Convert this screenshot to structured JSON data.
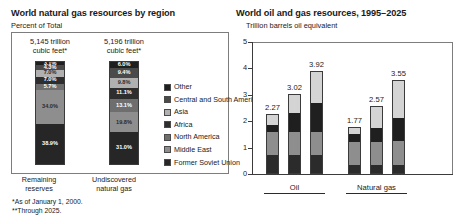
{
  "left_chart": {
    "title": "World natural gas resources by region",
    "subtitle": "Percent of Total",
    "bar1_header_line1": "5,145 trillion",
    "bar1_header_line2": "cubic feet*",
    "bar2_header_line1": "5,196 trillion",
    "bar2_header_line2": "cubic feet*",
    "bar1_label_line1": "Remaining",
    "bar1_label_line2": "reserves",
    "bar2_label_line1": "Undiscovered",
    "bar2_label_line2": "natural gas",
    "footnote1": "*As of January 1, 2000.",
    "footnote2": "**Through 2025.",
    "legend": [
      {
        "label": "Other",
        "color": "#1f1f1f"
      },
      {
        "label": "Central and South America",
        "color": "#4a4a4a"
      },
      {
        "label": "Asia",
        "color": "#b0b0b0"
      },
      {
        "label": "Africa",
        "color": "#2e2e2e"
      },
      {
        "label": "North America",
        "color": "#6e6e6e"
      },
      {
        "label": "Middle East",
        "color": "#8e8e8e"
      },
      {
        "label": "Former Soviet Union",
        "color": "#262626"
      }
    ]
  },
  "right_chart": {
    "title": "World oil and gas resources, 1995–2025",
    "subtitle": "Trillion barrels oil equivalent",
    "y_ticks": [
      "5",
      "4",
      "3",
      "2",
      "1",
      "0"
    ],
    "group1_label": "Oil",
    "group2_label": "Natural gas",
    "tick_labels": [
      "Low",
      "Mean",
      "High"
    ],
    "legend": [
      {
        "label_line1": "Undiscovered",
        "label_line2": "",
        "color": "#d4d4d4"
      },
      {
        "label_line1": "Reserve",
        "label_line2": "growth",
        "color": "#1f1f1f"
      },
      {
        "label_line1": "Remaining",
        "label_line2": "reserves",
        "color": "#8e8e8e"
      },
      {
        "label_line1": "Cumulative",
        "label_line2": "production",
        "color": "#2b2b2b"
      }
    ]
  },
  "chart_data": [
    {
      "type": "bar",
      "title": "World natural gas resources by region",
      "subtitle": "Percent of Total",
      "ylabel": "Percent of Total",
      "xlabel": "",
      "stacked": true,
      "categories": [
        "Remaining reserves",
        "Undiscovered natural gas"
      ],
      "category_totals_text": [
        "5,145 trillion cubic feet*",
        "5,196 trillion cubic feet*"
      ],
      "series": [
        {
          "name": "Other",
          "color": "#1f1f1f",
          "values": [
            3.1,
            6.0
          ]
        },
        {
          "name": "Central and South America",
          "color": "#4a4a4a",
          "values": [
            4.3,
            9.4
          ]
        },
        {
          "name": "Asia",
          "color": "#b0b0b0",
          "values": [
            7.0,
            9.8
          ]
        },
        {
          "name": "Africa",
          "color": "#2e2e2e",
          "values": [
            7.0,
            11.1
          ]
        },
        {
          "name": "North America",
          "color": "#6e6e6e",
          "values": [
            5.7,
            13.1
          ]
        },
        {
          "name": "Middle East",
          "color": "#8e8e8e",
          "values": [
            34.0,
            19.8
          ]
        },
        {
          "name": "Former Soviet Union",
          "color": "#262626",
          "values": [
            38.9,
            31.0
          ]
        }
      ],
      "value_labels": [
        [
          "3.1%",
          "4.3%",
          "7.0%",
          "7.0%",
          "5.7%",
          "34.0%",
          "38.9%"
        ],
        [
          "6.0%",
          "9.4%",
          "9.8%",
          "11.1%",
          "13.1%",
          "19.8%",
          "31.0%"
        ]
      ],
      "ylim": [
        0,
        100
      ],
      "grid": false,
      "legend_position": "right"
    },
    {
      "type": "bar",
      "title": "World oil and gas resources, 1995–2025",
      "subtitle": "Trillion barrels oil equivalent",
      "ylabel": "Trillion barrels oil equivalent",
      "xlabel": "",
      "stacked": true,
      "ylim": [
        0,
        5
      ],
      "yticks": [
        0,
        1,
        2,
        3,
        4,
        5
      ],
      "grid": false,
      "legend_position": "right",
      "groups": [
        "Oil",
        "Natural gas"
      ],
      "categories": [
        "Oil Low",
        "Oil Mean",
        "Oil High",
        "Natural gas Low",
        "Natural gas Mean",
        "Natural gas High"
      ],
      "totals": [
        2.27,
        3.02,
        3.92,
        1.77,
        2.57,
        3.55
      ],
      "total_labels": [
        "2.27",
        "3.02",
        "3.92",
        "1.77",
        "2.57",
        "3.55"
      ],
      "series": [
        {
          "name": "Cumulative production",
          "color": "#2b2b2b",
          "values": [
            0.71,
            0.71,
            0.71,
            0.3,
            0.3,
            0.3
          ]
        },
        {
          "name": "Remaining reserves",
          "color": "#8e8e8e",
          "values": [
            0.89,
            0.89,
            0.89,
            0.92,
            0.92,
            0.92
          ]
        },
        {
          "name": "Reserve growth",
          "color": "#1f1f1f",
          "values": [
            0.28,
            0.73,
            1.12,
            0.31,
            0.52,
            0.9
          ]
        },
        {
          "name": "Undiscovered",
          "color": "#d4d4d4",
          "values": [
            0.39,
            0.69,
            1.2,
            0.24,
            0.83,
            1.43
          ]
        }
      ]
    }
  ]
}
